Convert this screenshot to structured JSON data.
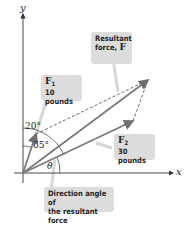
{
  "diagram": {
    "axes": {
      "x_label": "x",
      "y_label": "y"
    },
    "vectors": {
      "F1": {
        "name": "F",
        "subscript": "1",
        "magnitude_label": "10 pounds"
      },
      "F2": {
        "name": "F",
        "subscript": "2",
        "magnitude_label": "30 pounds"
      },
      "resultant": {
        "line1": "Resultant",
        "line2": "force, ",
        "symbol": "F"
      }
    },
    "angles": {
      "a20": "20°",
      "a65": "65°",
      "theta": "θ"
    },
    "callouts": {
      "direction_line1": "Direction angle of",
      "direction_line2": "the resultant force"
    },
    "colors": {
      "vector": "#7a7a7a",
      "axis": "#333333",
      "callout_bg": "#dcdcdc"
    }
  }
}
